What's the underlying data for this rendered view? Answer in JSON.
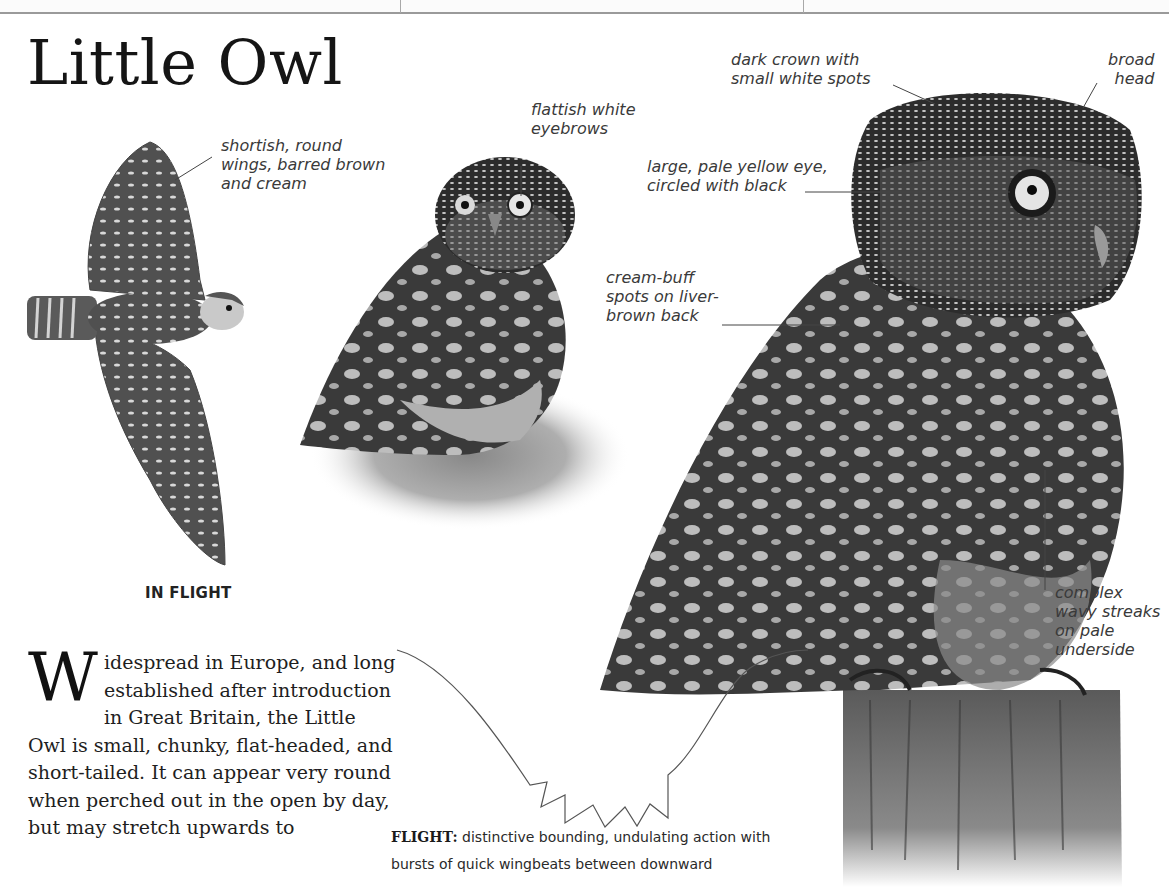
{
  "header": {
    "separators_x": [
      400,
      803
    ]
  },
  "page": {
    "title": "Little Owl",
    "in_flight_caption": "IN FLIGHT",
    "annotations": {
      "wings": "shortish, round\nwings, barred brown\nand cream",
      "eyebrows": "flattish white\neyebrows",
      "crown": "dark crown with\nsmall white spots",
      "head": "broad\nhead",
      "eye": "large, pale yellow eye,\ncircled with black",
      "back": "cream-buff\nspots on liver-\nbrown back",
      "underside": "complex\nwavy streaks\non pale\nunderside"
    },
    "body": {
      "dropcap": "W",
      "text": "idespread in Europe, and long established after introduction in Great Britain, the Little Owl is small, chunky, flat-headed, and short-tailed. It can appear very round when perched out in the open by day, but may stretch upwards to"
    },
    "flight_note": {
      "label": "FLIGHT:",
      "text": " distinctive bounding, undulating action with bursts of quick wingbeats between downward"
    }
  },
  "images": {
    "flying_owl": "illustration of Little Owl in flight, wings spread, barred brown and cream",
    "standing_owl": "photo of Little Owl standing on grass",
    "perched_owl": "large photo of Little Owl perched on wooden post"
  },
  "colors": {
    "ink": "#1e1e1e",
    "label": "#3a3a3a",
    "rule": "#9a9a9a"
  }
}
